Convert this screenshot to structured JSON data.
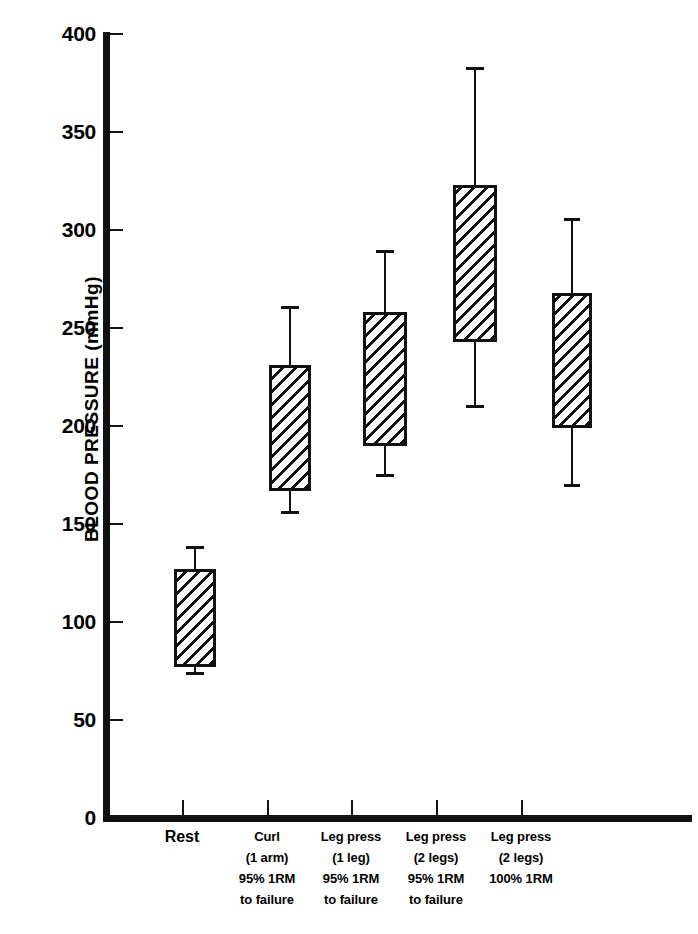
{
  "chart_data": {
    "type": "box",
    "title": "",
    "xlabel": "",
    "ylabel": "BLOOD PRESSURE  (mmHg)",
    "ylim": [
      0,
      400
    ],
    "ytick_labels": [
      "400",
      "350",
      "300",
      "250",
      "200",
      "150",
      "100",
      "50",
      "0"
    ],
    "ytick_values": [
      400,
      350,
      300,
      250,
      200,
      150,
      100,
      50,
      0
    ],
    "ytick_interval": 50,
    "grid": false,
    "legend": null,
    "units": "mmHg",
    "categories": [
      "Rest",
      "Curl (1 arm) 95% 1RM to failure",
      "Leg press (1 leg) 95% 1RM to failure",
      "Leg press (2 legs) 95% 1RM to failure",
      "Leg press (2 legs) 100% 1RM"
    ],
    "category_label_lines": [
      [
        "Rest"
      ],
      [
        "Curl",
        "(1 arm)",
        "95% 1RM",
        "to failure"
      ],
      [
        "Leg press",
        "(1 leg)",
        "95% 1RM",
        "to failure"
      ],
      [
        "Leg press",
        "(2 legs)",
        "95% 1RM",
        "to failure"
      ],
      [
        "Leg press",
        "(2 legs)",
        "100% 1RM"
      ]
    ],
    "boxes": [
      {
        "category": "Rest",
        "whisker_high": 139,
        "box_top": 127,
        "box_bottom": 77,
        "whisker_low": 73,
        "note": "systolic/diastolic range at rest"
      },
      {
        "category": "Curl (1 arm) 95% 1RM to failure",
        "whisker_high": 261,
        "box_top": 231,
        "box_bottom": 167,
        "whisker_low": 155
      },
      {
        "category": "Leg press (1 leg) 95% 1RM to failure",
        "whisker_high": 290,
        "box_top": 258,
        "box_bottom": 190,
        "whisker_low": 174
      },
      {
        "category": "Leg press (2 legs) 95% 1RM to failure",
        "whisker_high": 383,
        "box_top": 323,
        "box_bottom": 243,
        "whisker_low": 209
      },
      {
        "category": "Leg press (2 legs) 100% 1RM",
        "whisker_high": 306,
        "box_top": 268,
        "box_bottom": 199,
        "whisker_low": 169
      }
    ],
    "colors": {
      "axis": "#111111",
      "box_outline": "#111111",
      "box_fill": "#ffffff",
      "hatch": "#111111",
      "background": "#ffffff"
    }
  },
  "axis": {
    "y_title": "BLOOD PRESSURE  (mmHg)",
    "ticks": [
      {
        "label": "400",
        "value": 400
      },
      {
        "label": "350",
        "value": 350
      },
      {
        "label": "300",
        "value": 300
      },
      {
        "label": "250",
        "value": 250
      },
      {
        "label": "200",
        "value": 200
      },
      {
        "label": "150",
        "value": 150
      },
      {
        "label": "100",
        "value": 100
      },
      {
        "label": "50",
        "value": 50
      },
      {
        "label": "0",
        "value": 0
      }
    ]
  },
  "x_labels": [
    {
      "l1": "Rest",
      "l2": "",
      "l3": "",
      "l4": ""
    },
    {
      "l1": "Curl",
      "l2": "(1 arm)",
      "l3": "95% 1RM",
      "l4": "to failure"
    },
    {
      "l1": "Leg press",
      "l2": "(1 leg)",
      "l3": "95% 1RM",
      "l4": "to failure"
    },
    {
      "l1": "Leg press",
      "l2": "(2 legs)",
      "l3": "95% 1RM",
      "l4": "to failure"
    },
    {
      "l1": "Leg press",
      "l2": "(2 legs)",
      "l3": "100% 1RM",
      "l4": ""
    }
  ]
}
